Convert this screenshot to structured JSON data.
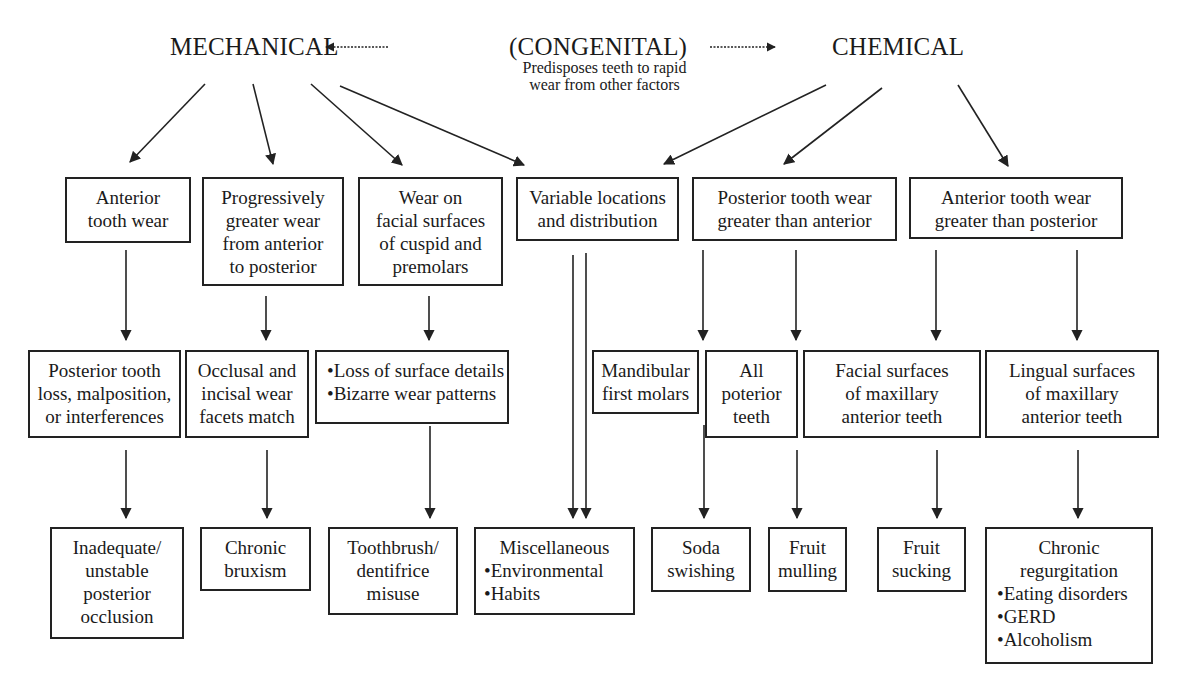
{
  "headings": {
    "mechanical": "MECHANICAL",
    "congenital": "(CONGENITAL)",
    "congenital_note": [
      "Predisposes teeth to rapid",
      "wear from other factors"
    ],
    "chemical": "CHEMICAL"
  },
  "row1": [
    {
      "id": "anterior-tooth-wear",
      "lines": [
        "Anterior",
        "tooth wear"
      ]
    },
    {
      "id": "progressively-greater-wear",
      "lines": [
        "Progressively",
        "greater wear",
        "from anterior",
        "to posterior"
      ]
    },
    {
      "id": "wear-facial-surfaces",
      "lines": [
        "Wear on",
        "facial surfaces",
        "of cuspid and",
        "premolars"
      ]
    },
    {
      "id": "variable-locations",
      "lines": [
        "Variable locations",
        "and distribution"
      ]
    },
    {
      "id": "posterior-greater-than-anterior",
      "lines": [
        "Posterior tooth wear",
        "greater than anterior"
      ]
    },
    {
      "id": "anterior-greater-than-posterior",
      "lines": [
        "Anterior tooth wear",
        "greater than posterior"
      ]
    }
  ],
  "row2": [
    {
      "id": "posterior-tooth-loss",
      "lines": [
        "Posterior tooth",
        "loss, malposition,",
        "or interferences"
      ]
    },
    {
      "id": "occlusal-incisal-facets",
      "lines": [
        "Occlusal and",
        "incisal wear",
        "facets match"
      ]
    },
    {
      "id": "loss-of-surface-details",
      "lines": [
        "•Loss of surface details",
        "•Bizarre wear patterns"
      ]
    },
    {
      "id": "mandibular-first-molars",
      "lines": [
        "Mandibular",
        "first molars"
      ]
    },
    {
      "id": "all-posterior-teeth",
      "lines": [
        "All",
        "poterior",
        "teeth"
      ]
    },
    {
      "id": "facial-maxillary-anterior",
      "lines": [
        "Facial surfaces",
        "of maxillary",
        "anterior teeth"
      ]
    },
    {
      "id": "lingual-maxillary-anterior",
      "lines": [
        "Lingual surfaces",
        "of maxillary",
        "anterior teeth"
      ]
    }
  ],
  "row3": [
    {
      "id": "inadequate-occlusion",
      "lines": [
        "Inadequate/",
        "unstable",
        "posterior",
        "occlusion"
      ]
    },
    {
      "id": "chronic-bruxism",
      "lines": [
        "Chronic",
        "bruxism"
      ]
    },
    {
      "id": "toothbrush-misuse",
      "lines": [
        "Toothbrush/",
        "dentifrice",
        "misuse"
      ]
    },
    {
      "id": "miscellaneous",
      "lines": [
        "Miscellaneous",
        "•Environmental",
        "•Habits"
      ]
    },
    {
      "id": "soda-swishing",
      "lines": [
        "Soda",
        "swishing"
      ]
    },
    {
      "id": "fruit-mulling",
      "lines": [
        "Fruit",
        "mulling"
      ]
    },
    {
      "id": "fruit-sucking",
      "lines": [
        "Fruit",
        "sucking"
      ]
    },
    {
      "id": "chronic-regurgitation",
      "lines": [
        "Chronic",
        "regurgitation",
        "•Eating disorders",
        "•GERD",
        "•Alcoholism"
      ]
    }
  ],
  "colors": {
    "line": "#222222",
    "background": "#ffffff",
    "text": "#1a1a1a"
  }
}
